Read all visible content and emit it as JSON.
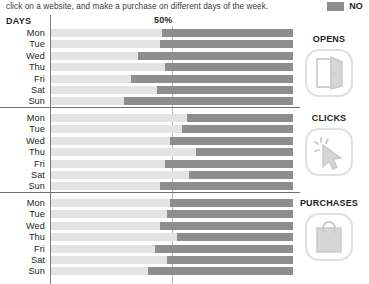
{
  "header": {
    "caption": "click on a website, and make a purchase on different days of the week.",
    "legend_label": "NO",
    "legend_color": "#8d8d8d"
  },
  "axis": {
    "days_header": "DAYS",
    "midpoint_label": "50%",
    "midpoint_value": 50,
    "track_color": "#e3e3e3"
  },
  "icons": {
    "opens": "open-door-icon",
    "clicks": "mouse-cursor-click-icon",
    "purchases": "shopping-bag-icon",
    "legend": "legend-swatch-icon"
  },
  "chart_data": {
    "type": "bar",
    "title": "click on a website, and make a purchase on different days of the week.",
    "orientation": "horizontal",
    "stacked": true,
    "xlabel": "",
    "ylabel": "DAYS",
    "xlim": [
      0,
      100
    ],
    "grid": false,
    "gridlines": [
      50
    ],
    "legend": [
      {
        "name": "NO",
        "color": "#8d8d8d"
      }
    ],
    "categories": [
      "Mon",
      "Tue",
      "Wed",
      "Thu",
      "Fri",
      "Sat",
      "Sun"
    ],
    "panels": [
      {
        "name": "OPENS",
        "label": "OPENS",
        "icon": "open-door-icon",
        "values": [
          54,
          55,
          64,
          53,
          67,
          56,
          70
        ]
      },
      {
        "name": "CLICKS",
        "label": "CLICKS",
        "icon": "mouse-cursor-click-icon",
        "values": [
          44,
          46,
          51,
          40,
          53,
          43,
          55
        ]
      },
      {
        "name": "PURCHASES",
        "label": "PURCHASES",
        "icon": "shopping-bag-icon",
        "values": [
          51,
          52,
          55,
          48,
          57,
          52,
          60
        ]
      }
    ]
  }
}
